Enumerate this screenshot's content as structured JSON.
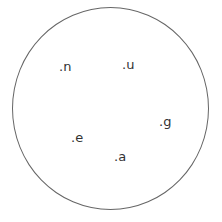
{
  "diagram": {
    "shape": "circle",
    "stroke_color": "#666666",
    "text_color": "#333333",
    "labels": [
      {
        "text": ".n",
        "x": 59,
        "y": 60
      },
      {
        "text": ".u",
        "x": 122,
        "y": 58
      },
      {
        "text": ".g",
        "x": 159,
        "y": 115
      },
      {
        "text": ".e",
        "x": 71,
        "y": 131
      },
      {
        "text": ".a",
        "x": 114,
        "y": 150
      }
    ]
  }
}
